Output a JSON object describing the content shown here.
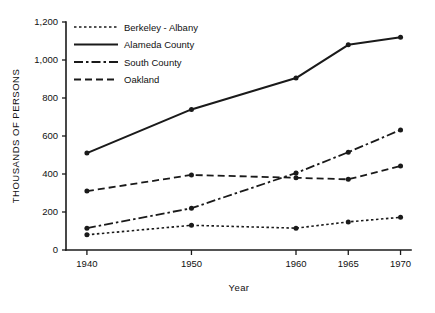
{
  "chart_data": {
    "type": "line",
    "title": "",
    "xlabel": "Year",
    "ylabel": "THOUSANDS OF PERSONS",
    "x": [
      1940,
      1950,
      1960,
      1965,
      1970
    ],
    "xtick_labels": [
      "1940",
      "1950",
      "1960",
      "1965",
      "1970"
    ],
    "xlim": [
      1938,
      1971
    ],
    "ylim": [
      0,
      1200
    ],
    "yticks": [
      0,
      200,
      400,
      600,
      800,
      1000,
      1200
    ],
    "ytick_labels": [
      "0",
      "200",
      "400",
      "600",
      "800",
      "1,000",
      "1,200"
    ],
    "grid": false,
    "legend_position": "top-left",
    "markers": "filled-circle",
    "series": [
      {
        "name": "Berkeley - Albany",
        "dash": "dotted",
        "dasharray": "2.5,2.5",
        "width": 1.6,
        "values": [
          80,
          130,
          115,
          148,
          172
        ]
      },
      {
        "name": "Alameda County",
        "dash": "solid",
        "dasharray": "",
        "width": 2.1,
        "values": [
          510,
          740,
          905,
          1080,
          1120
        ]
      },
      {
        "name": "South County",
        "dash": "dash-dot",
        "dasharray": "9,3,2.5,3",
        "width": 1.8,
        "values": [
          115,
          220,
          405,
          515,
          632
        ]
      },
      {
        "name": "Oakland",
        "dash": "dashed",
        "dasharray": "7,4",
        "width": 1.8,
        "values": [
          310,
          395,
          380,
          372,
          442
        ]
      }
    ]
  },
  "legend": {
    "items": [
      {
        "label": "Berkeley - Albany"
      },
      {
        "label": "Alameda County"
      },
      {
        "label": "South County"
      },
      {
        "label": "Oakland"
      }
    ]
  }
}
